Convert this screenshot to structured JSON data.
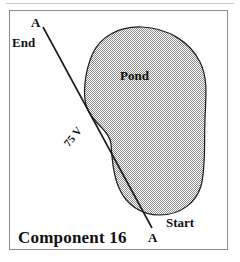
{
  "figure": {
    "caption": "Component 16",
    "frame": {
      "border_color": "#8d8d8d",
      "background_color": "#ffffff"
    },
    "top_rule_color": "#c9c9c9"
  },
  "labels": {
    "section_line_top": "A",
    "section_line_bottom": "A",
    "end_marker": "End",
    "start_marker": "Start",
    "pond": "Pond",
    "voltage": "75 V"
  },
  "shapes": {
    "pond": {
      "name": "pond",
      "fill_pattern": "stipple-50",
      "fill_color": "#9a9a9a",
      "outline_color": "#1a1a1a",
      "path": "M 92,55 C 100,36 120,26 142,27 C 168,28 190,42 200,62 C 208,78 206,96 205,118 C 204,142 206,168 201,186 C 196,203 180,215 160,215 C 140,215 126,204 119,188 C 113,174 112,158 111,144 C 110,137 106,132 102,128 C 96,122 90,116 87,108 C 82,94 85,72 92,55 Z"
    },
    "section_line": {
      "name": "section-line-a-a",
      "color": "#1a1a1a",
      "from": [
        43,
        27
      ],
      "to": [
        152,
        228
      ]
    }
  }
}
